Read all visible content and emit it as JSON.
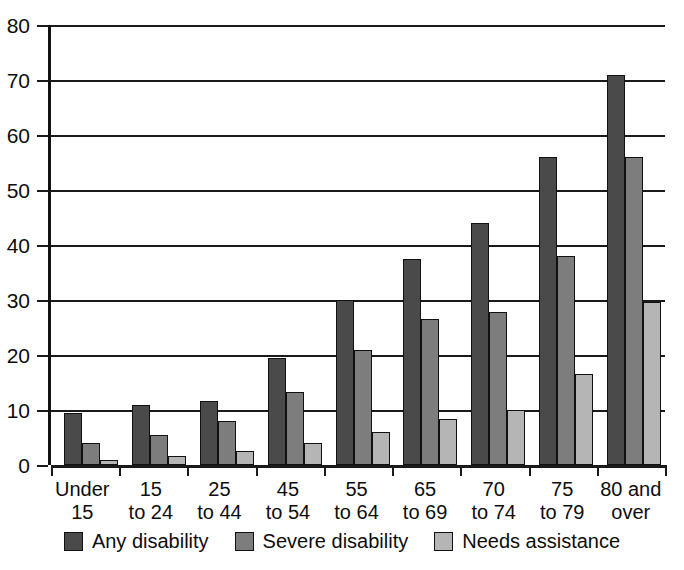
{
  "chart_data": {
    "type": "bar",
    "title": "",
    "subtitle": "",
    "xlabel": "",
    "ylabel": "",
    "ylim": [
      0,
      80
    ],
    "yticks": [
      0,
      10,
      20,
      30,
      40,
      50,
      60,
      70,
      80
    ],
    "ytick_labels": [
      "0",
      "10",
      "20",
      "30",
      "40",
      "50",
      "60",
      "70",
      "80"
    ],
    "grid": true,
    "legend_position": "bottom",
    "categories": [
      "Under 15",
      "15 to 24",
      "25 to 44",
      "45 to 54",
      "55 to 64",
      "65 to 69",
      "70 to 74",
      "75 to 79",
      "80 and over"
    ],
    "category_lines": [
      [
        "Under",
        "15"
      ],
      [
        "15",
        "to 24"
      ],
      [
        "25",
        "to 44"
      ],
      [
        "45",
        "to 54"
      ],
      [
        "55",
        "to 64"
      ],
      [
        "65",
        "to 69"
      ],
      [
        "70",
        "to 74"
      ],
      [
        "75",
        "to 79"
      ],
      [
        "80 and",
        "over"
      ]
    ],
    "series": [
      {
        "name": "Any disability",
        "color": "#4a4a4a",
        "values": [
          9.5,
          11.0,
          11.7,
          19.5,
          30.0,
          37.5,
          44.0,
          56.0,
          71.0
        ]
      },
      {
        "name": "Severe disability",
        "color": "#7d7d7d",
        "values": [
          4.0,
          5.5,
          8.0,
          13.2,
          21.0,
          26.5,
          27.9,
          38.0,
          56.0
        ]
      },
      {
        "name": "Needs assistance",
        "color": "#b5b5b5",
        "values": [
          1.0,
          1.6,
          2.5,
          4.0,
          6.0,
          8.4,
          10.0,
          16.5,
          29.6
        ]
      }
    ]
  },
  "colors": {
    "any_disability": "#4a4a4a",
    "severe_disability": "#7d7d7d",
    "needs_assistance": "#b5b5b5",
    "axis": "#1a1a1a",
    "background": "#ffffff"
  }
}
